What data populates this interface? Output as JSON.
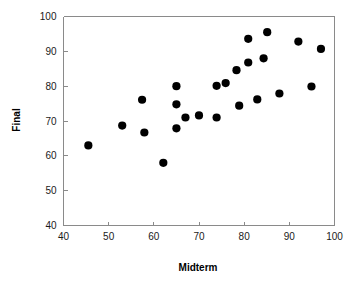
{
  "chart_data": {
    "type": "scatter",
    "title": "",
    "xlabel": "Midterm",
    "ylabel": "Final",
    "xlim": [
      40,
      100
    ],
    "ylim": [
      40,
      100
    ],
    "xticks": [
      40,
      50,
      60,
      70,
      80,
      90,
      100
    ],
    "yticks": [
      40,
      50,
      60,
      70,
      80,
      90,
      100
    ],
    "xtick_labels": [
      "40",
      "50",
      "60",
      "70",
      "80",
      "90",
      "100"
    ],
    "ytick_labels": [
      "40",
      "50",
      "60",
      "70",
      "80",
      "90",
      "100"
    ],
    "grid": false,
    "legend": null,
    "marker": "filled-circle",
    "marker_color": "#000000",
    "marker_size": 5,
    "points": [
      {
        "x": 45.5,
        "y": 63.0
      },
      {
        "x": 53.0,
        "y": 68.7
      },
      {
        "x": 57.4,
        "y": 76.1
      },
      {
        "x": 57.9,
        "y": 66.7
      },
      {
        "x": 62.1,
        "y": 58.0
      },
      {
        "x": 65.0,
        "y": 80.0
      },
      {
        "x": 65.0,
        "y": 74.8
      },
      {
        "x": 65.0,
        "y": 67.9
      },
      {
        "x": 67.0,
        "y": 71.0
      },
      {
        "x": 70.0,
        "y": 71.6
      },
      {
        "x": 73.9,
        "y": 71.0
      },
      {
        "x": 73.9,
        "y": 80.1
      },
      {
        "x": 75.9,
        "y": 80.9
      },
      {
        "x": 78.3,
        "y": 84.6
      },
      {
        "x": 78.9,
        "y": 74.4
      },
      {
        "x": 80.9,
        "y": 93.6
      },
      {
        "x": 80.9,
        "y": 86.8
      },
      {
        "x": 82.9,
        "y": 76.2
      },
      {
        "x": 84.3,
        "y": 88.0
      },
      {
        "x": 85.1,
        "y": 95.5
      },
      {
        "x": 87.8,
        "y": 77.9
      },
      {
        "x": 92.0,
        "y": 92.8
      },
      {
        "x": 94.9,
        "y": 79.9
      },
      {
        "x": 97.0,
        "y": 90.7
      }
    ]
  },
  "axes": {
    "x_title": "Midterm",
    "y_title": "Final"
  }
}
